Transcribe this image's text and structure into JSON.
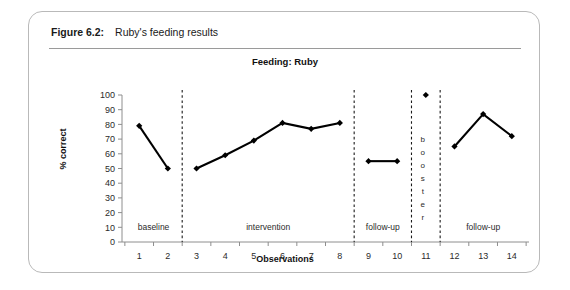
{
  "figure": {
    "label": "Figure 6.2:",
    "text": "Ruby's feeding results"
  },
  "chart_data": {
    "type": "line",
    "title": "Feeding: Ruby",
    "xlabel": "Observations",
    "ylabel": "% correct",
    "xlim": [
      0.4,
      14.6
    ],
    "ylim": [
      0,
      100
    ],
    "ytick_labels": [
      "0",
      "10",
      "20",
      "30",
      "40",
      "50",
      "60",
      "70",
      "80",
      "90",
      "100"
    ],
    "yticks": [
      0,
      10,
      20,
      30,
      40,
      50,
      60,
      70,
      80,
      90,
      100
    ],
    "xtick_labels": [
      "1",
      "2",
      "3",
      "4",
      "5",
      "6",
      "7",
      "8",
      "9",
      "10",
      "11",
      "12",
      "13",
      "14"
    ],
    "xticks": [
      1,
      2,
      3,
      4,
      5,
      6,
      7,
      8,
      9,
      10,
      11,
      12,
      13,
      14
    ],
    "grid": false,
    "legend": "none",
    "marker": "diamond",
    "line_color": "#000000",
    "x": [
      1,
      2,
      3,
      4,
      5,
      6,
      7,
      8,
      9,
      10,
      11,
      12,
      13,
      14
    ],
    "values": [
      79,
      50,
      50,
      59,
      69,
      81,
      77,
      81,
      55,
      55,
      100,
      65,
      87,
      72
    ],
    "segments": [
      {
        "phase": "baseline",
        "x": [
          1,
          2
        ],
        "values": [
          79,
          50
        ]
      },
      {
        "phase": "intervention",
        "x": [
          3,
          4,
          5,
          6,
          7,
          8
        ],
        "values": [
          50,
          59,
          69,
          81,
          77,
          81
        ]
      },
      {
        "phase": "follow-up",
        "x": [
          9,
          10
        ],
        "values": [
          55,
          55
        ]
      },
      {
        "phase": "booster",
        "x": [
          11
        ],
        "values": [
          100
        ]
      },
      {
        "phase": "follow-up",
        "x": [
          12,
          13,
          14
        ],
        "values": [
          65,
          87,
          72
        ]
      }
    ],
    "phases": [
      {
        "label": "baseline",
        "center_x": 1.5
      },
      {
        "label": "intervention",
        "center_x": 5.5
      },
      {
        "label": "follow-up",
        "center_x": 9.5
      },
      {
        "label": "booster",
        "center_x": 11.0,
        "orientation": "vertical"
      },
      {
        "label": "follow-up",
        "center_x": 13.0
      }
    ],
    "phase_dividers": [
      2.5,
      8.5,
      10.5,
      11.5
    ]
  }
}
